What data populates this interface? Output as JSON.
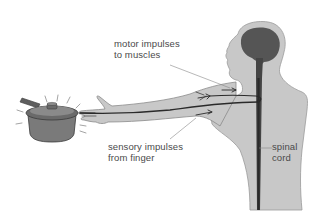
{
  "figure": {
    "labels": {
      "motor": {
        "line1": "motor impulses",
        "line2": "to muscles"
      },
      "sensory": {
        "line1": "sensory impulses",
        "line2": "from finger"
      },
      "spinal": {
        "line1": "spinal",
        "line2": "cord"
      }
    },
    "colors": {
      "body_fill": "#c8c8c8",
      "body_outline": "#8a8a8a",
      "brain": "#555555",
      "nerve": "#2a2a2a",
      "pan_fill": "#7a7a7a",
      "pan_dark": "#5e5e5e",
      "label_text": "#4a4a4a",
      "leader_line": "#888888"
    }
  }
}
